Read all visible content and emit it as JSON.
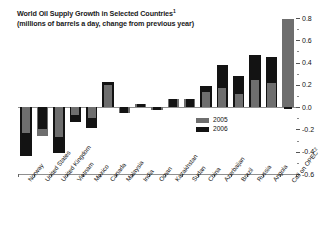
{
  "chart": {
    "title_line1": "World Oil Supply Growth in Selected Countries",
    "title_sup1": "1",
    "title_line2": "(millions of barrels a day, change from previous year)"
  },
  "legend": {
    "items": [
      {
        "label": "2005",
        "color": "#6e6e6e"
      },
      {
        "label": "2006",
        "color": "#131313"
      }
    ]
  },
  "axis": {
    "ticks": [
      "0.8",
      "0.6",
      "0.4",
      "0.2",
      "0.0",
      "-0.2",
      "-0.4",
      "-0.6"
    ]
  },
  "chart_data": {
    "type": "bar",
    "xlabel": "",
    "ylabel": "",
    "ylim": [
      -0.6,
      0.8
    ],
    "ytick_interval": 0.2,
    "grid": false,
    "legend_position": "inside-right",
    "bar_style": "overlapping",
    "categories": [
      "Norway",
      "United States",
      "United Kingdom",
      "Vietnam",
      "Mexico",
      "Canada",
      "Malaysia",
      "India",
      "Oman",
      "Kazakhstan",
      "Sudan",
      "China",
      "Azerbaijan",
      "Brazil",
      "Russia",
      "Angola",
      "Call on OPEC"
    ],
    "category_superscripts": {
      "Call on OPEC": "2"
    },
    "series": [
      {
        "name": "2005",
        "color": "#6e6e6e",
        "values": [
          -0.23,
          -0.26,
          -0.27,
          -0.07,
          -0.1,
          0.2,
          -0.05,
          0.03,
          -0.03,
          0.07,
          0.07,
          0.14,
          0.17,
          0.12,
          0.24,
          0.22,
          0.79
        ]
      },
      {
        "name": "2006",
        "color": "#131313",
        "values": [
          -0.44,
          -0.2,
          -0.41,
          -0.13,
          -0.19,
          0.23,
          -0.05,
          0.03,
          -0.03,
          0.07,
          0.07,
          0.19,
          0.38,
          0.28,
          0.47,
          0.45,
          -0.02
        ]
      }
    ]
  }
}
